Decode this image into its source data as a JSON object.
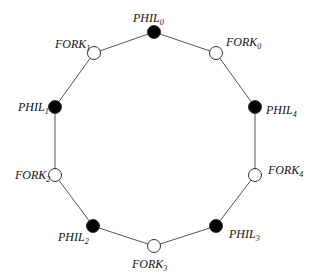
{
  "diagram": {
    "edge_color": "#555555",
    "nodes": [
      {
        "id": "PHIL0",
        "base": "PHIL",
        "sub": "0",
        "type": "philosopher",
        "fill": "#000000",
        "x": 154,
        "y": 32,
        "lx": 133,
        "ly": 22,
        "anchor": "start"
      },
      {
        "id": "FORK0",
        "base": "FORK",
        "sub": "0",
        "type": "fork",
        "fill": "#ffffff",
        "x": 216,
        "y": 53,
        "lx": 226,
        "ly": 46,
        "anchor": "start"
      },
      {
        "id": "PHIL4",
        "base": "PHIL",
        "sub": "4",
        "type": "philosopher",
        "fill": "#000000",
        "x": 255,
        "y": 107,
        "lx": 266,
        "ly": 114,
        "anchor": "start"
      },
      {
        "id": "FORK4",
        "base": "FORK",
        "sub": "4",
        "type": "fork",
        "fill": "#ffffff",
        "x": 255,
        "y": 175,
        "lx": 268,
        "ly": 174,
        "anchor": "start"
      },
      {
        "id": "PHIL3",
        "base": "PHIL",
        "sub": "3",
        "type": "philosopher",
        "fill": "#000000",
        "x": 216,
        "y": 226,
        "lx": 229,
        "ly": 238,
        "anchor": "start"
      },
      {
        "id": "FORK3",
        "base": "FORK",
        "sub": "3",
        "type": "fork",
        "fill": "#ffffff",
        "x": 154,
        "y": 246,
        "lx": 132,
        "ly": 268,
        "anchor": "start"
      },
      {
        "id": "PHIL2",
        "base": "PHIL",
        "sub": "2",
        "type": "philosopher",
        "fill": "#000000",
        "x": 93,
        "y": 226,
        "lx": 58,
        "ly": 241,
        "anchor": "start"
      },
      {
        "id": "FORK2",
        "base": "FORK",
        "sub": "2",
        "type": "fork",
        "fill": "#ffffff",
        "x": 55,
        "y": 175,
        "lx": 15,
        "ly": 179,
        "anchor": "start"
      },
      {
        "id": "PHIL1",
        "base": "PHIL",
        "sub": "1",
        "type": "philosopher",
        "fill": "#000000",
        "x": 55,
        "y": 107,
        "lx": 18,
        "ly": 111,
        "anchor": "start"
      },
      {
        "id": "FORK1",
        "base": "FORK",
        "sub": "1",
        "type": "fork",
        "fill": "#ffffff",
        "x": 94,
        "y": 53,
        "lx": 55,
        "ly": 48,
        "anchor": "start"
      }
    ],
    "edges": [
      [
        "PHIL0",
        "FORK0"
      ],
      [
        "FORK0",
        "PHIL4"
      ],
      [
        "PHIL4",
        "FORK4"
      ],
      [
        "FORK4",
        "PHIL3"
      ],
      [
        "PHIL3",
        "FORK3"
      ],
      [
        "FORK3",
        "PHIL2"
      ],
      [
        "PHIL2",
        "FORK2"
      ],
      [
        "FORK2",
        "PHIL1"
      ],
      [
        "PHIL1",
        "FORK1"
      ],
      [
        "FORK1",
        "PHIL0"
      ]
    ]
  }
}
